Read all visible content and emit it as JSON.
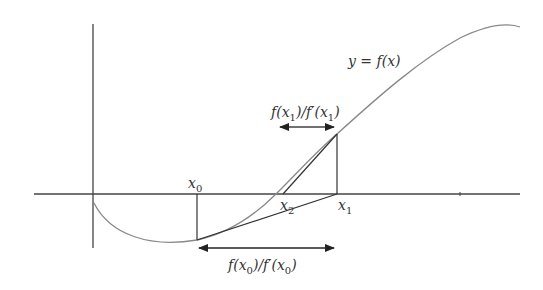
{
  "diagram": {
    "curve_label": "y = f(x)",
    "points": {
      "x0": {
        "label": "x",
        "sub": "0"
      },
      "x1": {
        "label": "x",
        "sub": "1"
      },
      "x2": {
        "label": "x",
        "sub": "2"
      }
    },
    "step_labels": {
      "upper": {
        "f": "f(x",
        "sub1": "1",
        "mid": ")/f′(x",
        "sub2": "1",
        "end": ")"
      },
      "lower": {
        "f": "f(x",
        "sub1": "0",
        "mid": ")/f′(x",
        "sub2": "0",
        "end": ")"
      }
    },
    "colors": {
      "axis": "#444444",
      "curve": "#888888",
      "lines": "#333333"
    }
  }
}
